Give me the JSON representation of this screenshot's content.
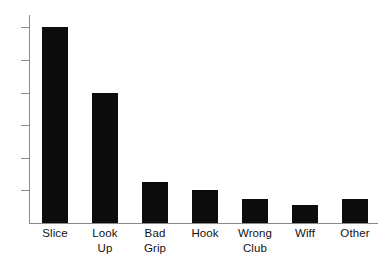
{
  "chart_data": {
    "type": "bar",
    "title": "",
    "subtitle": "",
    "xlabel": "",
    "ylabel": "",
    "categories": [
      "Slice",
      "Look Up",
      "Bad Grip",
      "Hook",
      "Wrong Club",
      "Wiff",
      "Other"
    ],
    "category_lines": [
      [
        "Slice"
      ],
      [
        "Look",
        "Up"
      ],
      [
        "Bad",
        "Grip"
      ],
      [
        "Hook"
      ],
      [
        "Wrong",
        "Club"
      ],
      [
        "Wiff"
      ],
      [
        "Other"
      ]
    ],
    "values": [
      6.0,
      4.0,
      1.25,
      1.0,
      0.75,
      0.55,
      0.75
    ],
    "series": [
      {
        "name": "Count",
        "values": [
          6.0,
          4.0,
          1.25,
          1.0,
          0.75,
          0.55,
          0.75
        ]
      }
    ],
    "ylim": [
      0,
      6.4
    ],
    "y_tick_values": [
      1,
      2,
      3,
      4,
      5,
      6
    ],
    "y_tick_labels": [
      "",
      "",
      "",
      "",
      "",
      ""
    ],
    "x_tick_labels": [
      "Slice",
      "Look Up",
      "Bad Grip",
      "Hook",
      "Wrong Club",
      "Wiff",
      "Other"
    ],
    "grid": false,
    "legend": false,
    "legend_position": "none",
    "bar_color": "#0c0c0c",
    "axis_color": "#8a8a8a",
    "background_color": "#ffffff",
    "annotations": []
  },
  "figure": {
    "name": "golf-mistakes-bar-chart",
    "bar_color": "#0c0c0c",
    "axis_color": "#8a8a8a",
    "text_color": "#121212",
    "background_color": "#ffffff"
  }
}
